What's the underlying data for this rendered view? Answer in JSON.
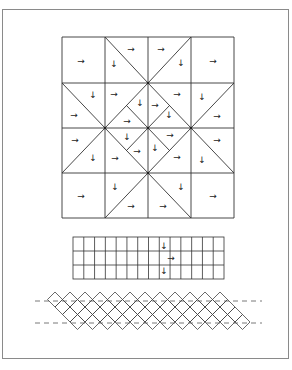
{
  "figure": {
    "frame": {
      "x": 2,
      "y": 9,
      "w": 287,
      "h": 350
    },
    "large_grid": {
      "x": 62,
      "y": 37,
      "cols": 4,
      "rows": 4,
      "col_lines": [
        62,
        105,
        148,
        191,
        234
      ],
      "row_lines": [
        37,
        83,
        128,
        173,
        218
      ],
      "diagonals": [
        [
          105,
          37,
          148,
          83
        ],
        [
          191,
          37,
          148,
          83
        ],
        [
          62,
          83,
          105,
          128
        ],
        [
          234,
          83,
          191,
          128
        ],
        [
          62,
          173,
          105,
          128
        ],
        [
          234,
          173,
          191,
          128
        ],
        [
          105,
          218,
          148,
          173
        ],
        [
          191,
          218,
          148,
          173
        ],
        [
          148,
          83,
          191,
          128
        ],
        [
          191,
          128,
          148,
          173
        ],
        [
          148,
          173,
          105,
          128
        ],
        [
          105,
          128,
          148,
          83
        ],
        [
          126.5,
          105.5,
          169.5,
          150.5
        ],
        [
          169.5,
          105.5,
          126.5,
          150.5
        ]
      ],
      "dots": [
        [
          148,
          83
        ],
        [
          105,
          128
        ],
        [
          191,
          128
        ],
        [
          148,
          128
        ],
        [
          148,
          173
        ]
      ],
      "arrows": [
        {
          "x": 81,
          "y": 61,
          "dir": "right"
        },
        {
          "x": 131,
          "y": 49,
          "dir": "right"
        },
        {
          "x": 114,
          "y": 64,
          "dir": "down"
        },
        {
          "x": 161,
          "y": 49,
          "dir": "right"
        },
        {
          "x": 181,
          "y": 63,
          "dir": "down"
        },
        {
          "x": 213,
          "y": 61,
          "dir": "right"
        },
        {
          "x": 93,
          "y": 95,
          "dir": "down"
        },
        {
          "x": 74,
          "y": 115,
          "dir": "right"
        },
        {
          "x": 114,
          "y": 94,
          "dir": "right"
        },
        {
          "x": 140,
          "y": 103,
          "dir": "down"
        },
        {
          "x": 127,
          "y": 121,
          "dir": "right"
        },
        {
          "x": 155,
          "y": 105,
          "dir": "right"
        },
        {
          "x": 177,
          "y": 94,
          "dir": "right"
        },
        {
          "x": 169,
          "y": 115,
          "dir": "down"
        },
        {
          "x": 202,
          "y": 97,
          "dir": "down"
        },
        {
          "x": 217,
          "y": 116,
          "dir": "right"
        },
        {
          "x": 75,
          "y": 140,
          "dir": "right"
        },
        {
          "x": 93,
          "y": 158,
          "dir": "down"
        },
        {
          "x": 127,
          "y": 137,
          "dir": "down"
        },
        {
          "x": 115,
          "y": 158,
          "dir": "right"
        },
        {
          "x": 137,
          "y": 151,
          "dir": "right"
        },
        {
          "x": 170,
          "y": 135,
          "dir": "right"
        },
        {
          "x": 155,
          "y": 148,
          "dir": "down"
        },
        {
          "x": 177,
          "y": 157,
          "dir": "right"
        },
        {
          "x": 217,
          "y": 140,
          "dir": "right"
        },
        {
          "x": 202,
          "y": 160,
          "dir": "down"
        },
        {
          "x": 81,
          "y": 196,
          "dir": "right"
        },
        {
          "x": 115,
          "y": 187,
          "dir": "down"
        },
        {
          "x": 131,
          "y": 206,
          "dir": "right"
        },
        {
          "x": 163,
          "y": 206,
          "dir": "right"
        },
        {
          "x": 181,
          "y": 187,
          "dir": "down"
        },
        {
          "x": 213,
          "y": 196,
          "dir": "right"
        }
      ]
    },
    "small_grid": {
      "x": 73,
      "y": 237,
      "w": 151,
      "h": 42,
      "cols": 14,
      "rows": 3,
      "arrows": [
        {
          "x": 164,
          "y": 246,
          "dir": "down"
        },
        {
          "x": 171,
          "y": 258,
          "dir": "right"
        },
        {
          "x": 164,
          "y": 271,
          "dir": "down"
        }
      ]
    },
    "band": {
      "dashed_lines": [
        {
          "x1": 35,
          "x2": 262,
          "y": 301
        },
        {
          "x1": 35,
          "x2": 262,
          "y": 323
        }
      ],
      "rows": 4,
      "row_start_x": 55,
      "row_start_y": 299.5,
      "step": 15,
      "count": 12,
      "half": 7.5
    },
    "arrow_glyphs": {
      "right": "→",
      "down": "↓"
    }
  }
}
